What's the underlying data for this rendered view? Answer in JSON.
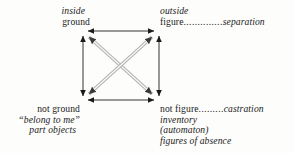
{
  "diagram": {
    "type": "semiotic-square",
    "background_color": "#fdfdfc",
    "ink_color": "#1b1b1b",
    "diagonal_color": "#9a9a9a",
    "corners": {
      "top_left": {
        "lines": [
          {
            "text": "inside",
            "style": "italic"
          },
          {
            "text": "ground",
            "style": "roman"
          }
        ]
      },
      "top_right": {
        "lines": [
          {
            "text": "outside",
            "style": "italic"
          }
        ],
        "relation": {
          "term": "figure",
          "leader": "..............",
          "value": "separation"
        }
      },
      "bottom_left": {
        "lines": [
          {
            "text": "not ground",
            "style": "roman"
          },
          {
            "text": "“belong to me”",
            "style": "italic"
          },
          {
            "text": "part objects",
            "style": "italic"
          }
        ]
      },
      "bottom_right": {
        "relation": {
          "term": "not figure",
          "leader": ".........",
          "value": "castration"
        },
        "lines": [
          {
            "text": "inventory",
            "style": "italic"
          },
          {
            "text": "(automaton)",
            "style": "italic"
          },
          {
            "text": "figures of absence",
            "style": "italic"
          }
        ]
      }
    },
    "edges": [
      {
        "name": "top-edge",
        "from": "top_left",
        "to": "top_right",
        "arrow": "double",
        "style": "solid"
      },
      {
        "name": "bottom-edge",
        "from": "bottom_left",
        "to": "bottom_right",
        "arrow": "double",
        "style": "solid"
      },
      {
        "name": "left-edge",
        "from": "top_left",
        "to": "bottom_left",
        "arrow": "double",
        "style": "solid"
      },
      {
        "name": "right-edge",
        "from": "top_right",
        "to": "bottom_right",
        "arrow": "double",
        "style": "solid"
      },
      {
        "name": "diagonal-tl-br",
        "from": "top_left",
        "to": "bottom_right",
        "arrow": "double",
        "style": "double-line-gray"
      },
      {
        "name": "diagonal-tr-bl",
        "from": "top_right",
        "to": "bottom_left",
        "arrow": "double",
        "style": "double-line-gray"
      }
    ]
  }
}
